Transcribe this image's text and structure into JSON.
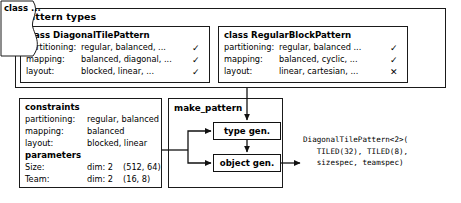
{
  "diagram": {
    "title": "Pattern types",
    "colors": {
      "ink": "#1a1a1a",
      "background": "#ffffff"
    },
    "cards": [
      {
        "name": "card-diagonal",
        "title": "class DiagonalTilePattern",
        "rows": [
          {
            "key": "partitioning:",
            "value": "regular, balanced, ...",
            "mark": "✓"
          },
          {
            "key": "mapping:",
            "value": "balanced, diagonal, ...",
            "mark": "✓"
          },
          {
            "key": "layout:",
            "value": "blocked, linear, ...",
            "mark": "✓"
          }
        ]
      },
      {
        "name": "card-regular",
        "title": "class RegularBlockPattern",
        "rows": [
          {
            "key": "partitioning:",
            "value": "regular, balanced ...",
            "mark": "✓"
          },
          {
            "key": "mapping:",
            "value": "balanced, cyclic, ...",
            "mark": "✓"
          },
          {
            "key": "layout:",
            "value": "linear, cartesian, ...",
            "mark": "✕"
          }
        ]
      }
    ],
    "more_card": {
      "label": "class ..."
    },
    "constraints": {
      "title": "constraints",
      "rows": [
        {
          "key": "partitioning:",
          "value": "regular, balanced"
        },
        {
          "key": "mapping:",
          "value": "balanced"
        },
        {
          "key": "layout:",
          "value": "blocked, linear"
        }
      ],
      "parameters_title": "parameters",
      "parameters": [
        {
          "key": "Size:",
          "dim": "dim: 2",
          "tuple": "(512, 64)"
        },
        {
          "key": "Team:",
          "dim": "dim: 2",
          "tuple": "(16, 8)"
        }
      ]
    },
    "make_pattern": {
      "title": "make_pattern",
      "type_gen_label": "type gen.",
      "object_gen_label": "object gen."
    },
    "output": "DiagonalTilePattern<2>(\n   TILED(32), TILED(8),\n   sizespec, teamspec)"
  }
}
